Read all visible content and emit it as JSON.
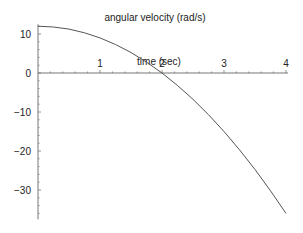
{
  "chart_data": {
    "type": "line",
    "title": "angular velocity (rad/s)",
    "xlabel": "time (sec)",
    "ylabel": "",
    "xlim": [
      0,
      4
    ],
    "ylim": [
      -37,
      13
    ],
    "x_ticks": [
      1,
      2,
      3,
      4
    ],
    "y_ticks": [
      10,
      0,
      -10,
      -20,
      -30
    ],
    "x_tick_labels": [
      "1",
      "2",
      "3",
      "4"
    ],
    "y_tick_labels": [
      "10",
      "0",
      "−10",
      "−20",
      "−30"
    ],
    "grid": false,
    "legend": null,
    "series": [
      {
        "name": "angular velocity",
        "x": [
          0,
          0.25,
          0.5,
          0.75,
          1.0,
          1.25,
          1.5,
          1.75,
          2.0,
          2.25,
          2.5,
          2.75,
          3.0,
          3.25,
          3.5,
          3.75,
          4.0
        ],
        "values": [
          12,
          11.8,
          11.25,
          10.3,
          9,
          7.3,
          5.25,
          2.8,
          0,
          -3.2,
          -6.75,
          -10.7,
          -15,
          -19.7,
          -24.75,
          -30.2,
          -36
        ]
      }
    ]
  },
  "plot": {
    "line_color": "#555555",
    "axis_color": "#777777"
  }
}
